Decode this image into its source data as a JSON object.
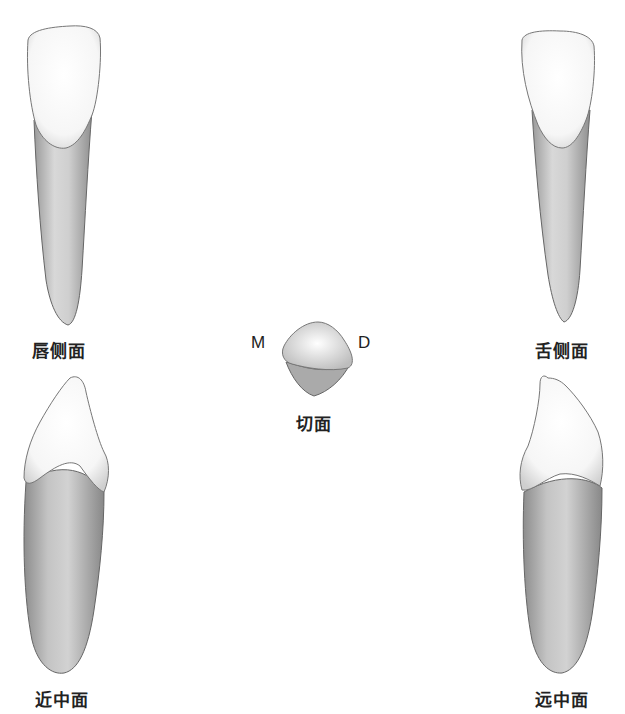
{
  "figure": {
    "views": [
      {
        "id": "labial",
        "label": "唇侧面"
      },
      {
        "id": "lingual",
        "label": "舌侧面"
      },
      {
        "id": "incisal",
        "label": "切面",
        "left_marker": "M",
        "right_marker": "D"
      },
      {
        "id": "mesial",
        "label": "近中面"
      },
      {
        "id": "distal",
        "label": "远中面"
      }
    ]
  },
  "colors": {
    "crown": "#fafafa",
    "root": "#c9c9c9",
    "outline": "#555555",
    "text": "#222222"
  }
}
